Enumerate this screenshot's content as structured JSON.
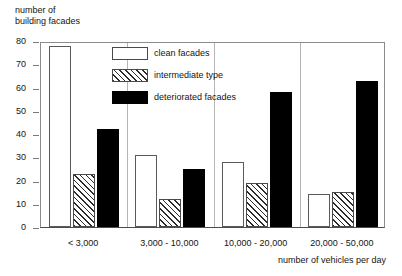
{
  "chart_data": {
    "type": "bar",
    "title": "",
    "ylabel": "number of\nbuilding facades",
    "xlabel": "number of vehicles per day",
    "categories": [
      "< 3,000",
      "3,000 - 10,000",
      "10,000 - 20,000",
      "20,000 - 50,000"
    ],
    "series": [
      {
        "name": "clean facades",
        "values": [
          78,
          31,
          28,
          14
        ],
        "color": "#ffffff",
        "pattern": "solid-white-outline"
      },
      {
        "name": "intermediate type",
        "values": [
          23,
          12,
          19,
          15
        ],
        "color": "#ffffff",
        "pattern": "diagonal-hatch"
      },
      {
        "name": "deteriorated facades",
        "values": [
          42,
          25,
          58,
          63
        ],
        "color": "#000000",
        "pattern": "solid-black"
      }
    ],
    "ylim": [
      0,
      80
    ],
    "ytick_labels": [
      "0",
      "10",
      "20",
      "30",
      "40",
      "50",
      "60",
      "70",
      "80"
    ],
    "ytick_values": [
      0,
      10,
      20,
      30,
      40,
      50,
      60,
      70,
      80
    ],
    "grid": false,
    "legend_position": "top-center-inside"
  },
  "legend": {
    "items": [
      {
        "label": "clean facades",
        "swatch": "clean-facades-swatch"
      },
      {
        "label": "intermediate type",
        "swatch": "intermediate-type-swatch"
      },
      {
        "label": "deteriorated facades",
        "swatch": "deteriorated-facades-swatch"
      }
    ]
  }
}
